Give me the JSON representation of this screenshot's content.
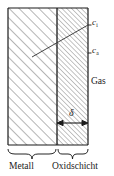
{
  "figure": {
    "background_color": "#ffffff",
    "line_color": "#1a1a1a",
    "hatch_color": "#6e6e6e",
    "labels": {
      "concentration_inner": "c",
      "concentration_inner_sub": "i",
      "concentration_outer": "c",
      "concentration_outer_sub": "a",
      "gas": "Gas",
      "thickness": "δ",
      "metal": "Metall",
      "oxide_layer": "Oxidschicht"
    },
    "regions": [
      {
        "name": "metal",
        "label": "Metall",
        "hatch": "diagonal-coarse",
        "x": 8,
        "width": 49
      },
      {
        "name": "oxide-layer",
        "label": "Oxidschicht",
        "hatch": "diagonal-fine",
        "x": 57,
        "width": 31
      }
    ],
    "box": {
      "x": 8,
      "y": 8,
      "width": 80,
      "height": 137
    },
    "boundary_x": 57,
    "profile_line": {
      "x1": 32,
      "y1": 57,
      "x2": 88,
      "y2": 25
    },
    "thickness_arrow": {
      "x1": 57,
      "x2": 88,
      "y": 123
    },
    "tick_marks": [
      {
        "label_ref": "concentration_inner",
        "x": 88,
        "y": 25
      },
      {
        "label_ref": "concentration_outer",
        "x": 88,
        "y": 53
      }
    ]
  }
}
